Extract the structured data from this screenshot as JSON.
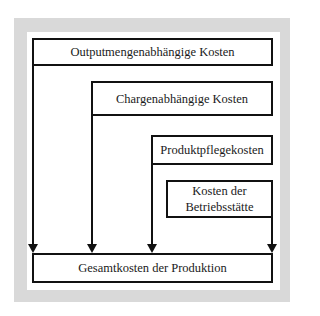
{
  "diagram": {
    "boxes": {
      "outputmengen": {
        "label": "Outputmengenabhängige Kosten"
      },
      "chargen": {
        "label": "Chargenabhängige Kosten"
      },
      "produktpflege": {
        "label": "Produktpflegekosten"
      },
      "betriebsstaette": {
        "line1": "Kosten der",
        "line2": "Betriebsstätte"
      },
      "gesamt": {
        "label": "Gesamtkosten der Produktion"
      }
    },
    "edges": [
      {
        "from": "Outputmengenabhängige Kosten",
        "to": "Gesamtkosten der Produktion"
      },
      {
        "from": "Chargenabhängige Kosten",
        "to": "Gesamtkosten der Produktion"
      },
      {
        "from": "Produktpflegekosten",
        "to": "Gesamtkosten der Produktion"
      },
      {
        "from": "Kosten der Betriebsstätte",
        "to": "Gesamtkosten der Produktion"
      }
    ],
    "colors": {
      "frame": "#d9d9d9",
      "line": "#111111",
      "text": "#1a1a1a"
    }
  }
}
